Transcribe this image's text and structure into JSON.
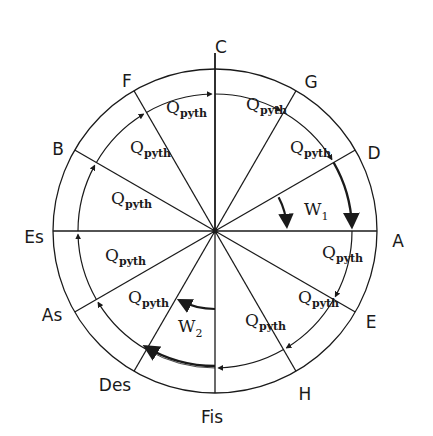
{
  "diagram": {
    "center": [
      215,
      231
    ],
    "outer_radius": 162,
    "inner_radius": 137,
    "notes": [
      {
        "label": "C",
        "angle": 0
      },
      {
        "label": "G",
        "angle": 30
      },
      {
        "label": "D",
        "angle": 60
      },
      {
        "label": "A",
        "angle": 90
      },
      {
        "label": "E",
        "angle": 120
      },
      {
        "label": "H",
        "angle": 150
      },
      {
        "label": "Fis",
        "angle": 180
      },
      {
        "label": "Des",
        "angle": 210
      },
      {
        "label": "As",
        "angle": 240
      },
      {
        "label": "Es",
        "angle": 270
      },
      {
        "label": "B",
        "angle": 300
      },
      {
        "label": "F",
        "angle": 330
      }
    ],
    "segment_label": {
      "main": "Q",
      "sub": "pyth"
    },
    "q_segments": [
      {
        "id": "C-G"
      },
      {
        "id": "G-D"
      },
      {
        "id": "A-E"
      },
      {
        "id": "E-H"
      },
      {
        "id": "H-Fis"
      },
      {
        "id": "Des-As"
      },
      {
        "id": "As-Es"
      },
      {
        "id": "Es-B"
      },
      {
        "id": "B-F"
      },
      {
        "id": "F-C"
      }
    ],
    "wolf_intervals": [
      {
        "main": "W",
        "sub": "1",
        "between": [
          "D",
          "A"
        ]
      },
      {
        "main": "W",
        "sub": "2",
        "between": [
          "Fis",
          "Des"
        ]
      }
    ],
    "colors": {
      "stroke": "#1a1a1a",
      "background": "#ffffff"
    }
  }
}
